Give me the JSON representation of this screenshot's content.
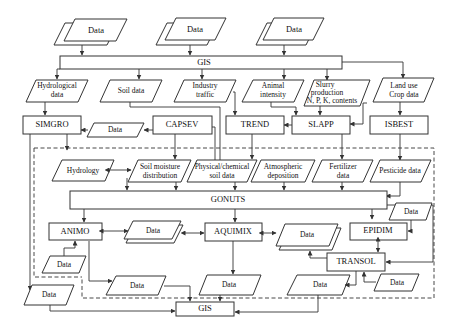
{
  "diagram": {
    "top_sources": [
      {
        "label": "Data"
      },
      {
        "label": "Data"
      },
      {
        "label": "Data"
      }
    ],
    "gis_top": {
      "label": "GIS"
    },
    "inputs": [
      {
        "label_l1": "Hydrological",
        "label_l2": "data"
      },
      {
        "label_l1": "Soil data",
        "label_l2": ""
      },
      {
        "label_l1": "Industry",
        "label_l2": "traffic"
      },
      {
        "label_l1": "Animal",
        "label_l2": "intensity"
      },
      {
        "label_l1": "Slurry",
        "label_l2": "production",
        "label_l3": "N, P, K, contents"
      },
      {
        "label_l1": "Land use",
        "label_l2": "Crop data"
      }
    ],
    "models": {
      "simgro": "SIMGRO",
      "capsev": "CAPSEV",
      "trend": "TREND",
      "slapp": "SLAPP",
      "isbest": "ISBEST",
      "gonuts": "GONUTS",
      "animo": "ANIMO",
      "aquimix": "AQUIMIX",
      "epidim": "EPIDIM",
      "transol": "TRANSOL"
    },
    "intermediate": {
      "simgro_data": "Data",
      "hydrology": "Hydrology",
      "soil_moisture_l1": "Soil moisture",
      "soil_moisture_l2": "distribution",
      "physchem_l1": "Physical/chemical",
      "physchem_l2": "soil data",
      "atmos_l1": "Atmospheric",
      "atmos_l2": "deposition",
      "fert_l1": "Fertilizer",
      "fert_l2": "data",
      "pesticide": "Pesticide data"
    },
    "lower_data": {
      "animo_aquimix": "Data",
      "aquimix_transol": "Data",
      "epidim_in": "Data",
      "animo_in": "Data",
      "animo_out": "Data",
      "aquimix_out": "Data",
      "transol_out": "Data",
      "transol_in": "Data",
      "simgro_out": "Data"
    },
    "gis_bottom": {
      "label": "GIS"
    }
  }
}
